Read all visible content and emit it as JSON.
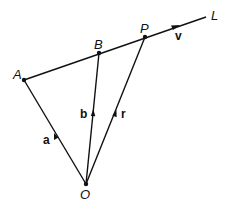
{
  "diagram": {
    "points": {
      "A": {
        "label": "A",
        "x": 24,
        "y": 80
      },
      "B": {
        "label": "B",
        "x": 99,
        "y": 53
      },
      "P": {
        "label": "P",
        "x": 145,
        "y": 37
      },
      "O": {
        "label": "O",
        "x": 86,
        "y": 184
      }
    },
    "line": {
      "label": "L",
      "direction_vector": "v"
    },
    "vectors": {
      "a": {
        "label": "a",
        "from": "O",
        "to": "A"
      },
      "b": {
        "label": "b",
        "from": "O",
        "to": "B"
      },
      "r": {
        "label": "r",
        "from": "O",
        "to": "P"
      },
      "v": {
        "label": "v",
        "along": "L"
      }
    },
    "colors": {
      "stroke": "#111111",
      "background": "#ffffff"
    }
  }
}
